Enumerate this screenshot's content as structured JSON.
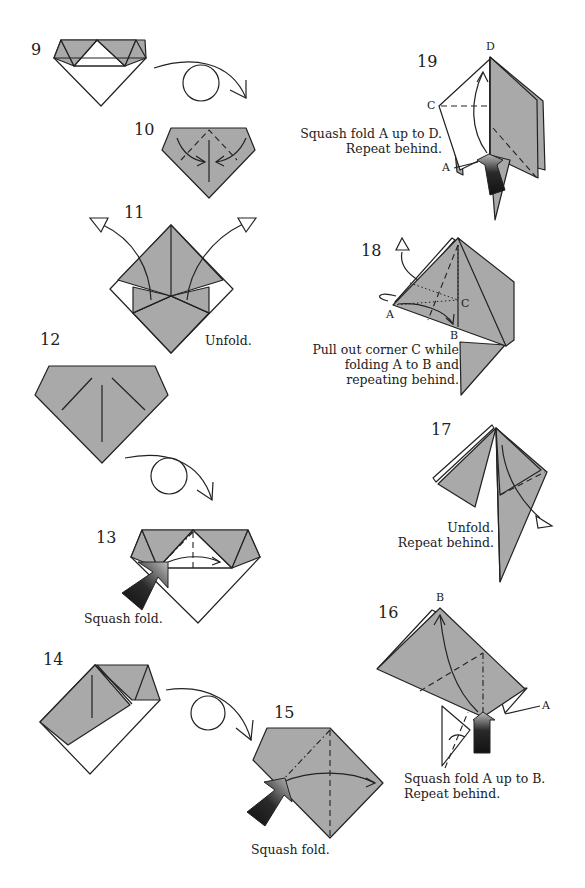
{
  "page": {
    "type": "origami-instruction-diagram",
    "colors": {
      "paper_colored": "#a9a9a9",
      "paper_white": "#ffffff",
      "line": "#222222",
      "push_arrow_dark": "#111111"
    }
  },
  "steps": [
    {
      "number": "9",
      "caption": "",
      "note": "Turn over"
    },
    {
      "number": "10",
      "caption": ""
    },
    {
      "number": "11",
      "caption": "Unfold."
    },
    {
      "number": "12",
      "caption": "",
      "note": "Turn over"
    },
    {
      "number": "13",
      "caption": "Squash fold."
    },
    {
      "number": "14",
      "caption": "",
      "note": "Turn over"
    },
    {
      "number": "15",
      "caption": "Squash fold."
    },
    {
      "number": "16",
      "caption_line1": "Squash fold A up to B.",
      "caption_line2": "Repeat behind.",
      "labels": {
        "top": "B",
        "right": "A"
      }
    },
    {
      "number": "17",
      "caption_line1": "Unfold.",
      "caption_line2": "Repeat behind."
    },
    {
      "number": "18",
      "caption_line1": "Pull out corner C while",
      "caption_line2": "folding A to B and",
      "caption_line3": "repeating behind.",
      "labels": {
        "left": "A",
        "bottom": "B",
        "corner": "C"
      }
    },
    {
      "number": "19",
      "caption_line1": "Squash fold A up to D.",
      "caption_line2": "Repeat behind.",
      "labels": {
        "top": "D",
        "left": "C",
        "bottom": "A"
      }
    }
  ],
  "symbols": {
    "turn_over": "turn-over-arrow-with-loop",
    "unfold": "hollow-triangle-arrowhead",
    "squash": "dark-push-arrow",
    "valley_fold": "dashed-line",
    "mountain_fold": "dash-dot-line",
    "x_ray": "dotted-line"
  }
}
